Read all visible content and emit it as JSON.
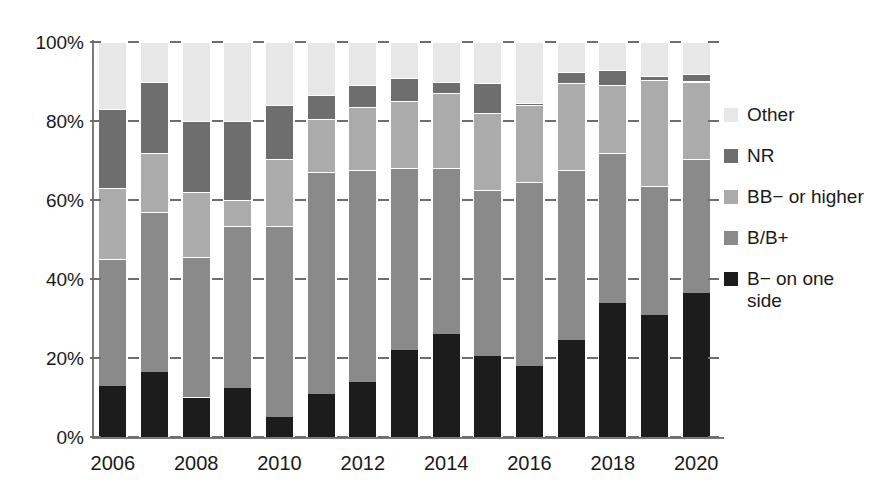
{
  "chart_data": {
    "type": "bar",
    "subtype": "stacked-percent",
    "title": "",
    "xlabel": "",
    "ylabel": "",
    "ylim": [
      0,
      100
    ],
    "yticks": [
      0,
      20,
      40,
      60,
      80,
      100
    ],
    "ytick_labels": [
      "0%",
      "20%",
      "40%",
      "60%",
      "80%",
      "100%"
    ],
    "grid": false,
    "legend_position": "right",
    "categories": [
      "2006",
      "2007",
      "2008",
      "2009",
      "2010",
      "2011",
      "2012",
      "2013",
      "2014",
      "2015",
      "2016",
      "2017",
      "2018",
      "2019",
      "2020"
    ],
    "xtick_labels": [
      "2006",
      "",
      "2008",
      "",
      "2010",
      "",
      "2012",
      "",
      "2014",
      "",
      "2016",
      "",
      "2018",
      "",
      "2020"
    ],
    "series": [
      {
        "name": "B− on one side",
        "color": "#1c1c1c",
        "values": [
          13,
          16.5,
          10,
          12.5,
          5,
          11,
          14,
          22,
          26,
          20.5,
          18,
          24.5,
          34,
          31,
          36.5
        ]
      },
      {
        "name": "B/B+",
        "color": "#8a8a8a",
        "values": [
          32,
          40.5,
          35.5,
          41,
          48.5,
          56,
          53.5,
          46,
          42,
          42,
          46.5,
          43,
          38,
          32.5,
          34
        ]
      },
      {
        "name": "BB− or higher",
        "color": "#ababab",
        "values": [
          18,
          15,
          16.5,
          6.5,
          17,
          13.5,
          16,
          17,
          19,
          19.5,
          19.5,
          22,
          17,
          27,
          19.5
        ]
      },
      {
        "name": "NR",
        "color": "#6e6e6e",
        "values": [
          20,
          18,
          18,
          20,
          13.5,
          6,
          5.5,
          6,
          3,
          7.5,
          0.5,
          3,
          4,
          1,
          2
        ]
      },
      {
        "name": "Other",
        "color": "#e7e7e7",
        "values": [
          17,
          10,
          20,
          20,
          16,
          13.5,
          11,
          9,
          10,
          10.5,
          15.5,
          7.5,
          7,
          8.5,
          8
        ]
      }
    ]
  },
  "legend": {
    "items": [
      {
        "label": "Other",
        "color": "#e7e7e7"
      },
      {
        "label": "NR",
        "color": "#6e6e6e"
      },
      {
        "label": "BB− or higher",
        "color": "#ababab"
      },
      {
        "label": "B/B+",
        "color": "#8a8a8a"
      },
      {
        "label": "B− on one side",
        "color": "#1c1c1c"
      }
    ]
  },
  "axes": {
    "y_tick_labels": [
      "100%",
      "80%",
      "60%",
      "40%",
      "20%",
      "0%"
    ],
    "x_tick_labels": [
      "2006",
      "2008",
      "2010",
      "2012",
      "2014",
      "2016",
      "2018",
      "2020"
    ]
  }
}
